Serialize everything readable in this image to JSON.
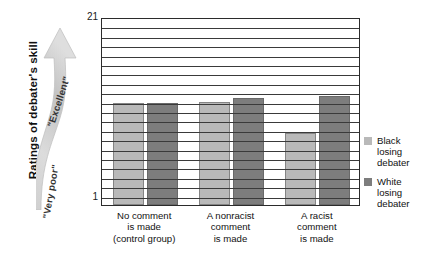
{
  "chart_data": {
    "type": "bar",
    "title": "",
    "ylabel": "Ratings of debater's skill",
    "xlabel": "",
    "ylim": [
      1,
      21
    ],
    "y_ticks": [
      1,
      21
    ],
    "y_tick_labels": [
      "1",
      "21"
    ],
    "grid": true,
    "gridlines": 20,
    "legend_position": "right",
    "scale_low_label": "\"Very poor\"",
    "scale_high_label": "\"Excellent\"",
    "categories": [
      "No comment is made (control group)",
      "A nonracist comment is made",
      "A racist comment is made"
    ],
    "category_lines": [
      [
        "No comment",
        "is made",
        "(control group)"
      ],
      [
        "A nonracist",
        "comment",
        "is made"
      ],
      [
        "A racist",
        "comment",
        "is made"
      ]
    ],
    "series": [
      {
        "name": "Black losing debater",
        "legend_lines": [
          "Black",
          "losing",
          "debater"
        ],
        "color": "#b9b9b9",
        "values": [
          11.9,
          12.0,
          8.7
        ]
      },
      {
        "name": "White losing debater",
        "legend_lines": [
          "White",
          "losing",
          "debater"
        ],
        "color": "#7d7d7d",
        "values": [
          11.9,
          12.4,
          12.6
        ]
      }
    ]
  },
  "colors": {
    "axis": "#2b2b2b",
    "gridline": "#3a3a3a",
    "black_debater": "#b9b9b9",
    "white_debater": "#7d7d7d",
    "arrow_light": "#e3e3e3",
    "arrow_dark": "#a8a8a8",
    "background": "#ffffff"
  }
}
